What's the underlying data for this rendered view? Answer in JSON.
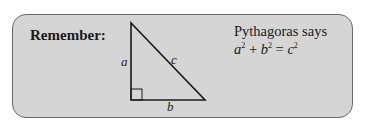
{
  "callout": {
    "heading": "Remember:",
    "triangle": {
      "side_a": "a",
      "side_b": "b",
      "side_c": "c",
      "right_angle_marker": "square"
    },
    "statement": "Pythagoras says",
    "formula": {
      "a": "a",
      "b": "b",
      "c": "c",
      "exp": "2",
      "plus": "+",
      "equals": "="
    }
  },
  "colors": {
    "box_fill": "#d5d5d5",
    "box_border": "#6a6a6a",
    "text": "#1a1a1a"
  }
}
